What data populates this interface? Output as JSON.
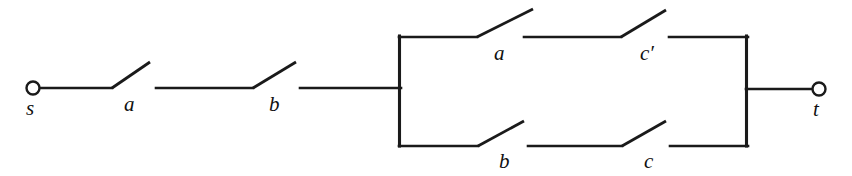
{
  "diagram": {
    "type": "switching-circuit",
    "background_color": "#ffffff",
    "line_color": "#1a1a1a",
    "terminals": [
      {
        "id": "s",
        "label": "s",
        "cx": 33,
        "cy": 88,
        "r": 7,
        "label_x": 26,
        "label_y": 98
      },
      {
        "id": "t",
        "label": "t",
        "cx": 819,
        "cy": 89,
        "r": 7,
        "label_x": 813,
        "label_y": 99
      }
    ],
    "switches": [
      {
        "id": "sw-a-series",
        "label": "a",
        "label_x": 124,
        "label_y": 94,
        "pivot_x": 112,
        "pivot_y": 88,
        "tip_x": 150,
        "tip_y": 62,
        "wire_from_x": 40,
        "wire_to_x": 112,
        "wire_y": 88
      },
      {
        "id": "sw-b-series",
        "label": "b",
        "label_x": 269,
        "label_y": 94,
        "pivot_x": 253,
        "pivot_y": 88,
        "tip_x": 296,
        "tip_y": 62,
        "wire_from_x": 156,
        "wire_to_x": 253,
        "wire_y": 88
      },
      {
        "id": "sw-a-top",
        "label": "a",
        "label_x": 494,
        "label_y": 43,
        "pivot_x": 477,
        "pivot_y": 37,
        "tip_x": 533,
        "tip_y": 9,
        "wire_from_x": 399,
        "wire_to_x": 477,
        "wire_y": 37
      },
      {
        "id": "sw-cprime-top",
        "label": "c′",
        "label_x": 640,
        "label_y": 43,
        "pivot_x": 621,
        "pivot_y": 37,
        "tip_x": 666,
        "tip_y": 10,
        "wire_from_x": 524,
        "wire_to_x": 621,
        "wire_y": 37
      },
      {
        "id": "sw-b-bottom",
        "label": "b",
        "label_x": 499,
        "label_y": 151,
        "pivot_x": 478,
        "pivot_y": 146,
        "tip_x": 524,
        "tip_y": 121,
        "wire_from_x": 399,
        "wire_to_x": 478,
        "wire_y": 146
      },
      {
        "id": "sw-c-bottom",
        "label": "c",
        "label_x": 644,
        "label_y": 151,
        "pivot_x": 622,
        "pivot_y": 146,
        "tip_x": 666,
        "tip_y": 121,
        "wire_from_x": 528,
        "wire_to_x": 622,
        "wire_y": 146
      }
    ],
    "wires": [
      {
        "id": "wire-s-to-a",
        "x1": 40,
        "y1": 88,
        "x2": 112,
        "y2": 88
      },
      {
        "id": "wire-a-to-b",
        "x1": 156,
        "y1": 88,
        "x2": 253,
        "y2": 88
      },
      {
        "id": "wire-b-to-bus",
        "x1": 300,
        "y1": 88,
        "x2": 400,
        "y2": 88
      },
      {
        "id": "wire-top-right",
        "x1": 669,
        "y1": 37,
        "x2": 748,
        "y2": 37
      },
      {
        "id": "wire-bottom-right",
        "x1": 670,
        "y1": 146,
        "x2": 748,
        "y2": 146
      },
      {
        "id": "wire-bus-to-t",
        "x1": 747,
        "y1": 89,
        "x2": 813,
        "y2": 89
      }
    ],
    "buses": [
      {
        "id": "left-bus",
        "x": 399,
        "y_top": 36,
        "y_bottom": 146
      },
      {
        "id": "right-bus",
        "x": 747,
        "y_top": 36,
        "y_bottom": 146
      }
    ],
    "branches": {
      "series_path": [
        "a",
        "b"
      ],
      "parallel_top": [
        "a",
        "c′"
      ],
      "parallel_bottom": [
        "b",
        "c"
      ]
    }
  },
  "labels": {
    "terminal_s": "s",
    "terminal_t": "t",
    "switch_a_series": "a",
    "switch_b_series": "b",
    "switch_a_top": "a",
    "switch_cprime_top": "c′",
    "switch_b_bottom": "b",
    "switch_c_bottom": "c"
  }
}
